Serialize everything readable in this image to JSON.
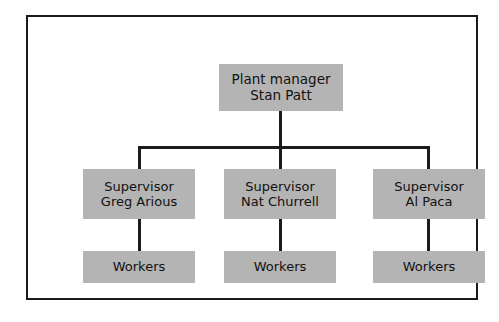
{
  "diagram": {
    "type": "organization-chart",
    "colors": {
      "node_fill": "#b4b4b4",
      "node_text": "#111111",
      "connector": "#1b1b1b",
      "frame_border": "#1b1b1b",
      "background": "#ffffff"
    },
    "root": {
      "title": "Plant manager",
      "name": "Stan Patt"
    },
    "supervisors": [
      {
        "title": "Supervisor",
        "name": "Greg Arious",
        "reports": {
          "label": "Workers"
        }
      },
      {
        "title": "Supervisor",
        "name": "Nat Churrell",
        "reports": {
          "label": "Workers"
        }
      },
      {
        "title": "Supervisor",
        "name": "Al Paca",
        "reports": {
          "label": "Workers"
        }
      }
    ]
  }
}
